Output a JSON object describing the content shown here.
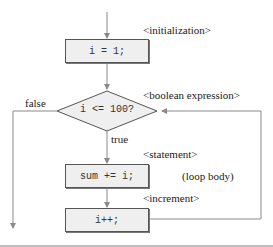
{
  "diagram": {
    "type": "flowchart",
    "nodes": {
      "init": {
        "code": "i = 1;",
        "annotation": "<initialization>"
      },
      "condition": {
        "code": "i <= 100?",
        "annotation": "<boolean expression>"
      },
      "statement": {
        "code": "sum += i;",
        "annotation": "<statement>"
      },
      "increment": {
        "code": "i++;",
        "annotation": "<increment>"
      }
    },
    "edge_labels": {
      "false": "false",
      "true": "true"
    },
    "group_label": "(loop body)",
    "colors": {
      "box_fill": "#efefef",
      "box_border": "#555555",
      "line": "#8a8a8a",
      "text": "#222222"
    }
  }
}
